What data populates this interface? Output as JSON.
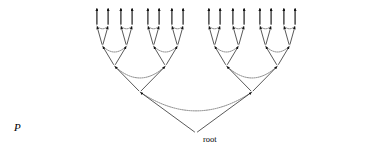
{
  "figure": {
    "type": "binary-tree-diagram",
    "labels": {
      "p": "P",
      "root": "root"
    },
    "colors": {
      "edge": "#111111",
      "arc": "#555555",
      "node": "#111111",
      "background": "#ffffff",
      "text": "#111111"
    },
    "geometry": {
      "width": 392,
      "height": 153,
      "depth": 5,
      "leaf_count": 32,
      "root": {
        "x": 196,
        "y": 133
      },
      "level_y": [
        8,
        26,
        46,
        66,
        92,
        133
      ],
      "level_leaf_half_span": [
        0,
        5.6,
        12.0,
        25.5,
        56.0,
        104.0
      ],
      "margin_x": 14,
      "leaf_spacing": 11.6
    },
    "label_positions": {
      "p": {
        "x": 14,
        "y": 132
      },
      "root": {
        "x": 203,
        "y": 143
      }
    },
    "markers": {
      "arrowhead": "filled-triangle",
      "node_dot_radius": 1.15
    }
  }
}
